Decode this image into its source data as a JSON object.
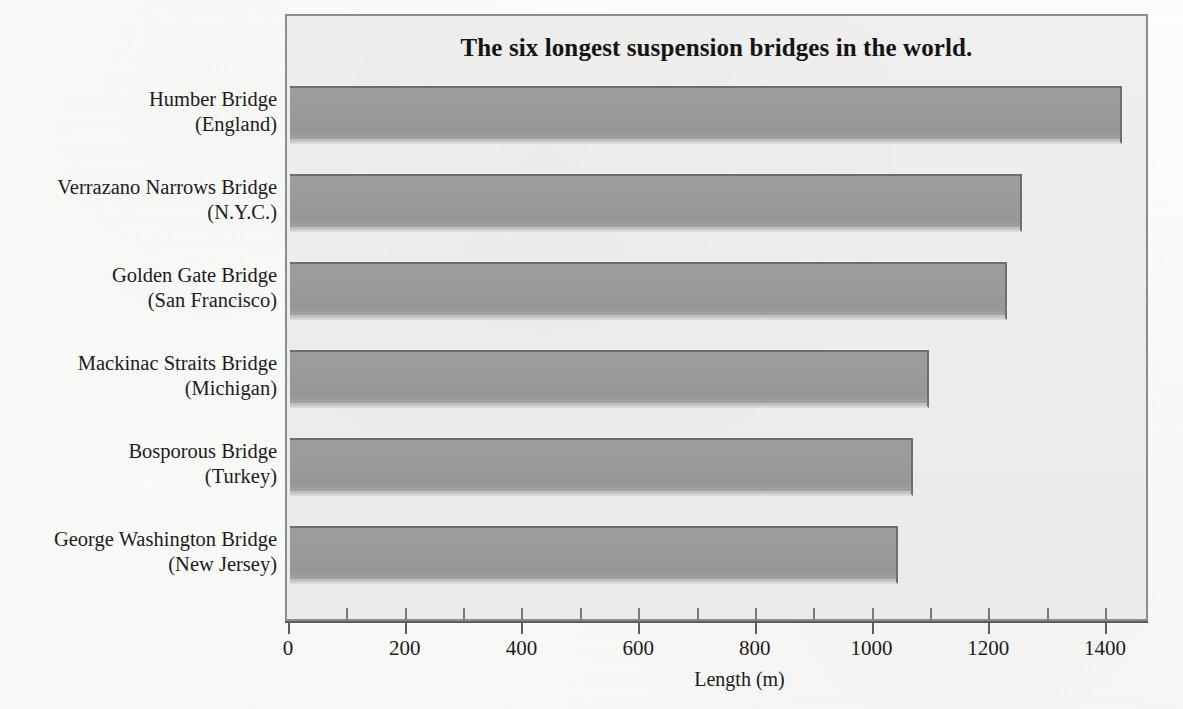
{
  "chart_data": {
    "type": "bar",
    "orientation": "horizontal",
    "title": "The six longest suspension bridges in the world.",
    "xlabel": "Length (m)",
    "ylabel": "",
    "xlim": [
      0,
      1480
    ],
    "xticks": [
      0,
      200,
      400,
      600,
      800,
      1000,
      1200,
      1400
    ],
    "xticklabels": [
      "0",
      "200",
      "400",
      "600",
      "800",
      "1000",
      "1200",
      "1400"
    ],
    "minor_ticks": [
      100,
      300,
      500,
      700,
      900,
      1100,
      1300
    ],
    "grid": false,
    "legend": false,
    "categories": [
      "Humber Bridge (England)",
      "Verrazano Narrows Bridge (N.Y.C.)",
      "Golden Gate Bridge (San Francisco)",
      "Mackinac Straits Bridge (Michigan)",
      "Bosporous Bridge (Turkey)",
      "George Washington Bridge (New Jersey)"
    ],
    "values": [
      1426,
      1254,
      1228,
      1095,
      1067,
      1042
    ],
    "bar_color": "#9a9a9a",
    "plot_background": "#ececeb",
    "frame_color": "#8d8d8d"
  },
  "bars": [
    {
      "name": "Humber Bridge",
      "location": "(England)",
      "value": 1426
    },
    {
      "name": "Verrazano Narrows Bridge",
      "location": "(N.Y.C.)",
      "value": 1254
    },
    {
      "name": "Golden Gate Bridge",
      "location": "(San Francisco)",
      "value": 1228
    },
    {
      "name": "Mackinac Straits Bridge",
      "location": "(Michigan)",
      "value": 1095
    },
    {
      "name": "Bosporous Bridge",
      "location": "(Turkey)",
      "value": 1067
    },
    {
      "name": "George Washington Bridge",
      "location": "(New Jersey)",
      "value": 1042
    }
  ]
}
